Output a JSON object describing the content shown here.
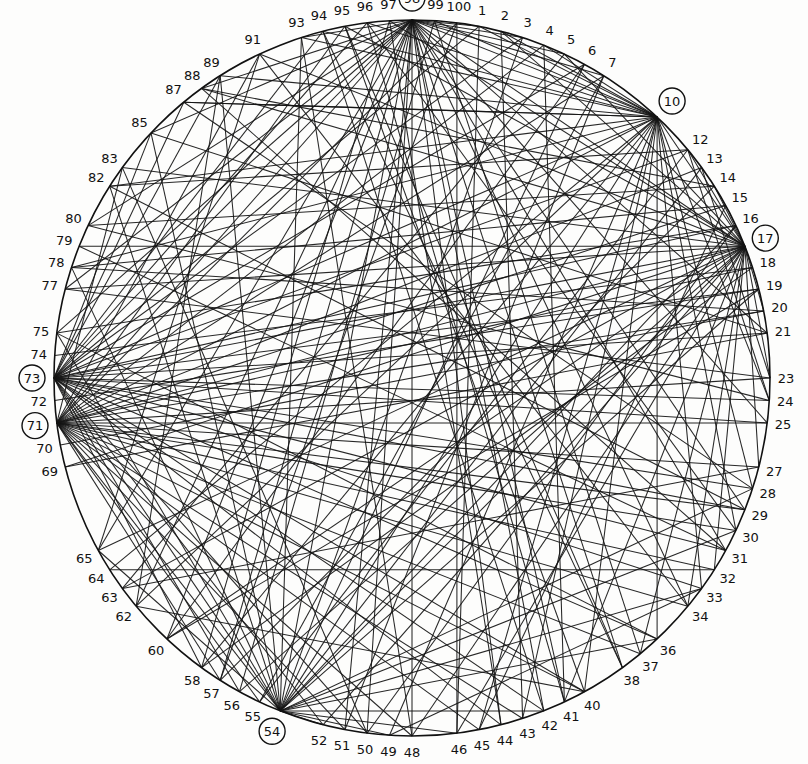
{
  "diagram": {
    "type": "chord-network",
    "node_count": 100,
    "circle": {
      "cx": 412,
      "cy": 378,
      "r": 358
    },
    "labeled_nodes": [
      1,
      2,
      3,
      4,
      5,
      6,
      7,
      10,
      12,
      13,
      14,
      15,
      16,
      17,
      18,
      19,
      20,
      21,
      23,
      24,
      25,
      27,
      28,
      29,
      30,
      31,
      32,
      33,
      34,
      36,
      37,
      38,
      40,
      41,
      42,
      43,
      44,
      45,
      46,
      48,
      49,
      50,
      51,
      52,
      54,
      55,
      56,
      57,
      58,
      60,
      62,
      63,
      64,
      65,
      69,
      70,
      71,
      72,
      73,
      74,
      75,
      77,
      78,
      79,
      80,
      82,
      83,
      85,
      87,
      88,
      89,
      91,
      93,
      94,
      95,
      96,
      97,
      98,
      99,
      100
    ],
    "hub_nodes": [
      98,
      10,
      17,
      73,
      71,
      54
    ],
    "ink_color": "#151515",
    "paper_color": "#fdfdfc",
    "edges": [
      [
        98,
        1
      ],
      [
        98,
        3
      ],
      [
        98,
        5
      ],
      [
        98,
        7
      ],
      [
        98,
        10
      ],
      [
        98,
        17
      ],
      [
        98,
        21
      ],
      [
        98,
        25
      ],
      [
        98,
        29
      ],
      [
        98,
        31
      ],
      [
        98,
        34
      ],
      [
        98,
        38
      ],
      [
        98,
        41
      ],
      [
        98,
        42
      ],
      [
        98,
        44
      ],
      [
        98,
        48
      ],
      [
        98,
        50
      ],
      [
        98,
        51
      ],
      [
        98,
        54
      ],
      [
        98,
        57
      ],
      [
        98,
        60
      ],
      [
        98,
        62
      ],
      [
        98,
        65
      ],
      [
        98,
        71
      ],
      [
        98,
        73
      ],
      [
        98,
        75
      ],
      [
        98,
        77
      ],
      [
        98,
        80
      ],
      [
        98,
        85
      ],
      [
        98,
        88
      ],
      [
        98,
        93
      ],
      [
        10,
        1
      ],
      [
        10,
        2
      ],
      [
        10,
        4
      ],
      [
        10,
        93
      ],
      [
        10,
        94
      ],
      [
        10,
        96
      ],
      [
        10,
        99
      ],
      [
        10,
        17
      ],
      [
        10,
        24
      ],
      [
        10,
        28
      ],
      [
        10,
        30
      ],
      [
        10,
        33
      ],
      [
        10,
        36
      ],
      [
        10,
        40
      ],
      [
        10,
        43
      ],
      [
        10,
        45
      ],
      [
        10,
        49
      ],
      [
        10,
        54
      ],
      [
        10,
        58
      ],
      [
        10,
        62
      ],
      [
        10,
        64
      ],
      [
        10,
        71
      ],
      [
        10,
        73
      ],
      [
        10,
        78
      ],
      [
        10,
        82
      ],
      [
        10,
        87
      ],
      [
        10,
        89
      ],
      [
        17,
        2
      ],
      [
        17,
        5
      ],
      [
        17,
        12
      ],
      [
        17,
        14
      ],
      [
        17,
        20
      ],
      [
        17,
        23
      ],
      [
        17,
        27
      ],
      [
        17,
        32
      ],
      [
        17,
        34
      ],
      [
        17,
        37
      ],
      [
        17,
        41
      ],
      [
        17,
        46
      ],
      [
        17,
        48
      ],
      [
        17,
        52
      ],
      [
        17,
        54
      ],
      [
        17,
        56
      ],
      [
        17,
        60
      ],
      [
        17,
        63
      ],
      [
        17,
        65
      ],
      [
        17,
        69
      ],
      [
        17,
        71
      ],
      [
        17,
        73
      ],
      [
        17,
        77
      ],
      [
        17,
        79
      ],
      [
        17,
        83
      ],
      [
        17,
        88
      ],
      [
        17,
        91
      ],
      [
        17,
        95
      ],
      [
        17,
        97
      ],
      [
        73,
        1
      ],
      [
        73,
        3
      ],
      [
        73,
        6
      ],
      [
        73,
        12
      ],
      [
        73,
        16
      ],
      [
        73,
        19
      ],
      [
        73,
        21
      ],
      [
        73,
        24
      ],
      [
        73,
        25
      ],
      [
        73,
        28
      ],
      [
        73,
        29
      ],
      [
        73,
        31
      ],
      [
        73,
        33
      ],
      [
        73,
        36
      ],
      [
        73,
        40
      ],
      [
        73,
        42
      ],
      [
        73,
        44
      ],
      [
        73,
        50
      ],
      [
        73,
        52
      ],
      [
        73,
        54
      ],
      [
        73,
        56
      ],
      [
        73,
        58
      ],
      [
        73,
        85
      ],
      [
        73,
        87
      ],
      [
        73,
        89
      ],
      [
        73,
        94
      ],
      [
        73,
        96
      ],
      [
        71,
        4
      ],
      [
        71,
        7
      ],
      [
        71,
        13
      ],
      [
        71,
        15
      ],
      [
        71,
        18
      ],
      [
        71,
        20
      ],
      [
        71,
        23
      ],
      [
        71,
        25
      ],
      [
        71,
        27
      ],
      [
        71,
        29
      ],
      [
        71,
        30
      ],
      [
        71,
        32
      ],
      [
        71,
        34
      ],
      [
        71,
        37
      ],
      [
        71,
        40
      ],
      [
        71,
        43
      ],
      [
        71,
        45
      ],
      [
        71,
        48
      ],
      [
        71,
        51
      ],
      [
        71,
        54
      ],
      [
        71,
        55
      ],
      [
        71,
        57
      ],
      [
        71,
        83
      ],
      [
        71,
        91
      ],
      [
        71,
        95
      ],
      [
        71,
        100
      ],
      [
        54,
        3
      ],
      [
        54,
        6
      ],
      [
        54,
        13
      ],
      [
        54,
        16
      ],
      [
        54,
        19
      ],
      [
        54,
        28
      ],
      [
        54,
        30
      ],
      [
        54,
        33
      ],
      [
        54,
        36
      ],
      [
        54,
        42
      ],
      [
        54,
        46
      ],
      [
        54,
        49
      ],
      [
        54,
        52
      ],
      [
        54,
        65
      ],
      [
        54,
        75
      ],
      [
        54,
        78
      ],
      [
        54,
        82
      ],
      [
        54,
        85
      ],
      [
        54,
        89
      ],
      [
        54,
        93
      ],
      [
        82,
        29
      ],
      [
        80,
        24
      ],
      [
        79,
        31
      ],
      [
        77,
        23
      ],
      [
        78,
        20
      ],
      [
        87,
        10
      ],
      [
        88,
        14
      ],
      [
        89,
        62
      ],
      [
        91,
        65
      ],
      [
        93,
        48
      ],
      [
        83,
        50
      ],
      [
        85,
        21
      ],
      [
        75,
        36
      ],
      [
        62,
        40
      ],
      [
        63,
        27
      ],
      [
        64,
        32
      ],
      [
        60,
        19
      ],
      [
        57,
        14
      ],
      [
        58,
        18
      ],
      [
        55,
        12
      ],
      [
        51,
        7
      ],
      [
        50,
        16
      ],
      [
        49,
        33
      ],
      [
        46,
        100
      ],
      [
        45,
        15
      ],
      [
        44,
        97
      ],
      [
        42,
        94
      ],
      [
        38,
        95
      ],
      [
        37,
        99
      ],
      [
        34,
        91
      ],
      [
        31,
        88
      ],
      [
        30,
        96
      ],
      [
        28,
        87
      ],
      [
        24,
        12
      ],
      [
        23,
        13
      ],
      [
        21,
        69
      ],
      [
        20,
        70
      ],
      [
        19,
        72
      ],
      [
        18,
        74
      ],
      [
        16,
        75
      ],
      [
        15,
        78
      ],
      [
        14,
        80
      ],
      [
        12,
        82
      ],
      [
        6,
        60
      ],
      [
        5,
        63
      ],
      [
        4,
        41
      ],
      [
        2,
        43
      ],
      [
        1,
        46
      ],
      [
        7,
        55
      ],
      [
        99,
        56
      ],
      [
        100,
        57
      ],
      [
        97,
        58
      ],
      [
        96,
        41
      ],
      [
        95,
        40
      ],
      [
        94,
        38
      ]
    ]
  }
}
